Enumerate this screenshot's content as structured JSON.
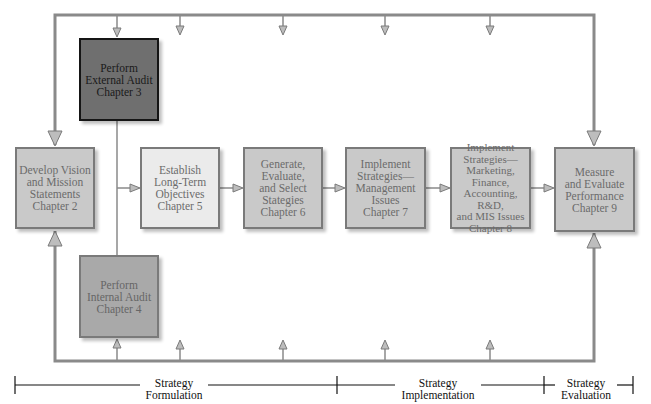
{
  "diagram": {
    "boxes": {
      "external_audit": "Perform\nExternal Audit\nChapter 3",
      "vision_mission": "Develop Vision\nand Mission\nStatements\nChapter 2",
      "long_term_objectives": "Establish\nLong-Term\nObjectives\nChapter 5",
      "generate_strategies": "Generate,\nEvaluate,\nand Select\nStategies\nChapter 6",
      "implement_management": "Implement\nStrategies—\nManagement\nIssues\nChapter 7",
      "implement_marketing": "Implement\nStrategies—\nMarketing,\nFinance,\nAccounting, R&D,\nand MIS Issues\nChapter 8",
      "measure_evaluate": "Measure\nand Evaluate\nPerformance\nChapter 9",
      "internal_audit": "Perform\nInternal Audit\nChapter 4"
    },
    "phases": {
      "formulation": "Strategy\nFormulation",
      "implementation": "Strategy\nImplementation",
      "evaluation": "Strategy\nEvaluation"
    },
    "colors": {
      "line": "#8a8a8a",
      "arrow_fill": "#b8b8b8",
      "dark_box": "#6f6f6f",
      "mid_box": "#c9c9c9",
      "light_box": "#ebebeb",
      "internal_box": "#a9a9a9"
    }
  }
}
